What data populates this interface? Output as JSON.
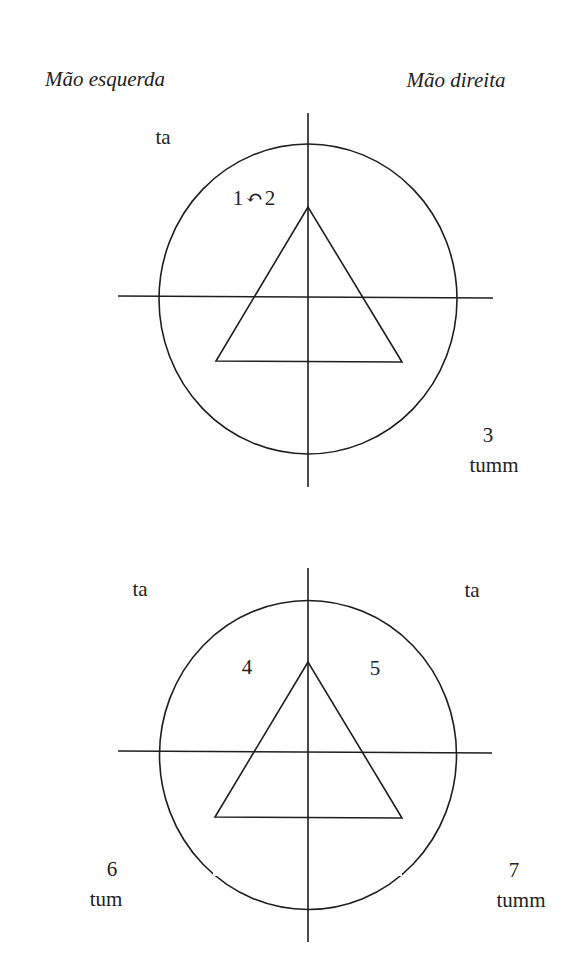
{
  "titles": {
    "left_hand": "Mão esquerda",
    "right_hand": "Mão direita"
  },
  "diagram_top": {
    "upper_left_syllable": "ta",
    "beats_label": {
      "first": "1",
      "arrow_icon": "↶",
      "second": "2"
    },
    "lower_right": {
      "number": "3",
      "syllable": "tumm"
    }
  },
  "diagram_bottom": {
    "upper_left_syllable": "ta",
    "upper_right_syllable": "ta",
    "left_beat": "4",
    "right_beat": "5",
    "lower_left": {
      "number": "6",
      "syllable": "tum"
    },
    "lower_right": {
      "number": "7",
      "syllable": "tumm"
    }
  },
  "colors": {
    "stroke": "#1e1e1e",
    "text": "#222222",
    "background": "#ffffff"
  }
}
